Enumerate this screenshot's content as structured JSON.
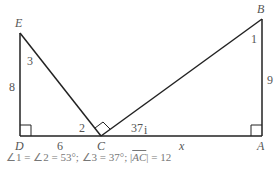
{
  "diagram": {
    "type": "geometry",
    "points": {
      "E": {
        "label": "E",
        "x": 20,
        "y": 33
      },
      "D": {
        "label": "D",
        "x": 20,
        "y": 136
      },
      "C": {
        "label": "C",
        "x": 101,
        "y": 136
      },
      "A": {
        "label": "A",
        "x": 262,
        "y": 136
      },
      "B": {
        "label": "B",
        "x": 262,
        "y": 19
      }
    },
    "segments": [
      {
        "from": "E",
        "to": "D"
      },
      {
        "from": "D",
        "to": "A"
      },
      {
        "from": "E",
        "to": "C"
      },
      {
        "from": "C",
        "to": "B"
      },
      {
        "from": "B",
        "to": "A"
      }
    ],
    "right_angles": [
      "D",
      "A",
      "C"
    ],
    "side_labels": {
      "ED": "8",
      "DC": "6",
      "CA": "x",
      "AB": "9"
    },
    "angle_labels": {
      "angle1": "1",
      "angle2": "2",
      "angle3": "3",
      "angle_at_C_right": "37",
      "angle_at_C_right_mark": "i"
    },
    "caption": {
      "part1": "∠1 = ∠2 = 53°; ∠3 = 37°; |",
      "ac": "AC",
      "part2": "| = 12"
    },
    "line_color": "#222222",
    "label_color": "#555555"
  }
}
